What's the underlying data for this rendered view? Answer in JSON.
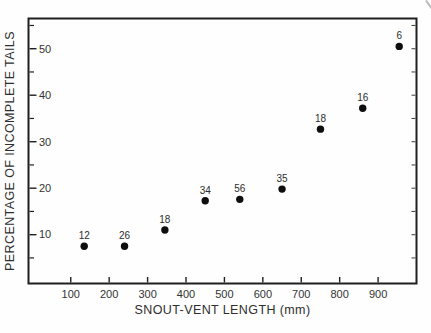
{
  "figure": {
    "background_color": "#fefefe",
    "ink_color": "#1f1f1f",
    "text_color": "#333333",
    "marker_color": "#0e0e0e",
    "artifact_color": "#bbbbbb"
  },
  "chart_data": {
    "type": "scatter",
    "title": "",
    "xlabel": "SNOUT-VENT LENGTH (mm)",
    "ylabel": "PERCENTAGE OF INCOMPLETE TAILS",
    "xlim": [
      -10,
      1000
    ],
    "ylim": [
      -0.5,
      56.5
    ],
    "x_ticks": [
      100,
      200,
      300,
      400,
      500,
      600,
      700,
      800,
      900
    ],
    "y_ticks_major": [
      10,
      20,
      30,
      40,
      50
    ],
    "y_ticks_minor": [
      5,
      15,
      25,
      35,
      45,
      55
    ],
    "right_border_ticks": [
      5,
      10,
      15,
      20,
      25,
      30,
      35,
      40,
      45,
      50,
      55
    ],
    "grid": false,
    "legend": "none",
    "marker_shape": "filled-circle",
    "point_label_position": "above",
    "points": [
      {
        "x": 135,
        "y": 7.5,
        "label": "12"
      },
      {
        "x": 240,
        "y": 7.5,
        "label": "26"
      },
      {
        "x": 345,
        "y": 11,
        "label": "18"
      },
      {
        "x": 450,
        "y": 17.3,
        "label": "34"
      },
      {
        "x": 540,
        "y": 17.6,
        "label": "56"
      },
      {
        "x": 650,
        "y": 19.8,
        "label": "35"
      },
      {
        "x": 750,
        "y": 32.7,
        "label": "18"
      },
      {
        "x": 860,
        "y": 37.2,
        "label": "16"
      },
      {
        "x": 955,
        "y": 50.5,
        "label": "6"
      }
    ]
  }
}
